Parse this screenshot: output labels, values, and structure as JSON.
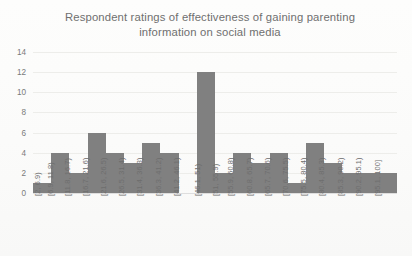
{
  "chart_data": {
    "type": "bar",
    "title": "Respondent ratings of effectiveness of gaining parenting information on social media",
    "title_lines": [
      "Respondent ratings of effectiveness of gaining parenting",
      "information on social media"
    ],
    "xlabel": "",
    "ylabel": "",
    "ylim": [
      0,
      14
    ],
    "yticks": [
      0,
      2,
      4,
      6,
      8,
      10,
      12,
      14
    ],
    "grid": true,
    "legend": null,
    "bar_color": "#808080",
    "categories": [
      "[2, 6.9)",
      "[6.9, 11.8)",
      "[11.8, 16.7)",
      "[16.7, 21.6)",
      "[21.6, 26.5)",
      "[26.5, 31.4)",
      "[31.4, 36.3)",
      "[36.3, 41.2)",
      "[41.2, 46.1)",
      "[46.1, 51)",
      "[51, 55.9)",
      "[55.9, 60.8)",
      "[60.8, 65.7)",
      "[65.7, 70.6)",
      "[70.6, 75.5)",
      "[75.5, 80.4)",
      "[80.4, 85.3)",
      "[85.3, 90.2)",
      "[90.2, 95.1)",
      "[95.1, 100]"
    ],
    "values": [
      1,
      4,
      2,
      6,
      4,
      3,
      5,
      4,
      0,
      12,
      2,
      4,
      3,
      4,
      1,
      5,
      3,
      2,
      2,
      2
    ]
  }
}
